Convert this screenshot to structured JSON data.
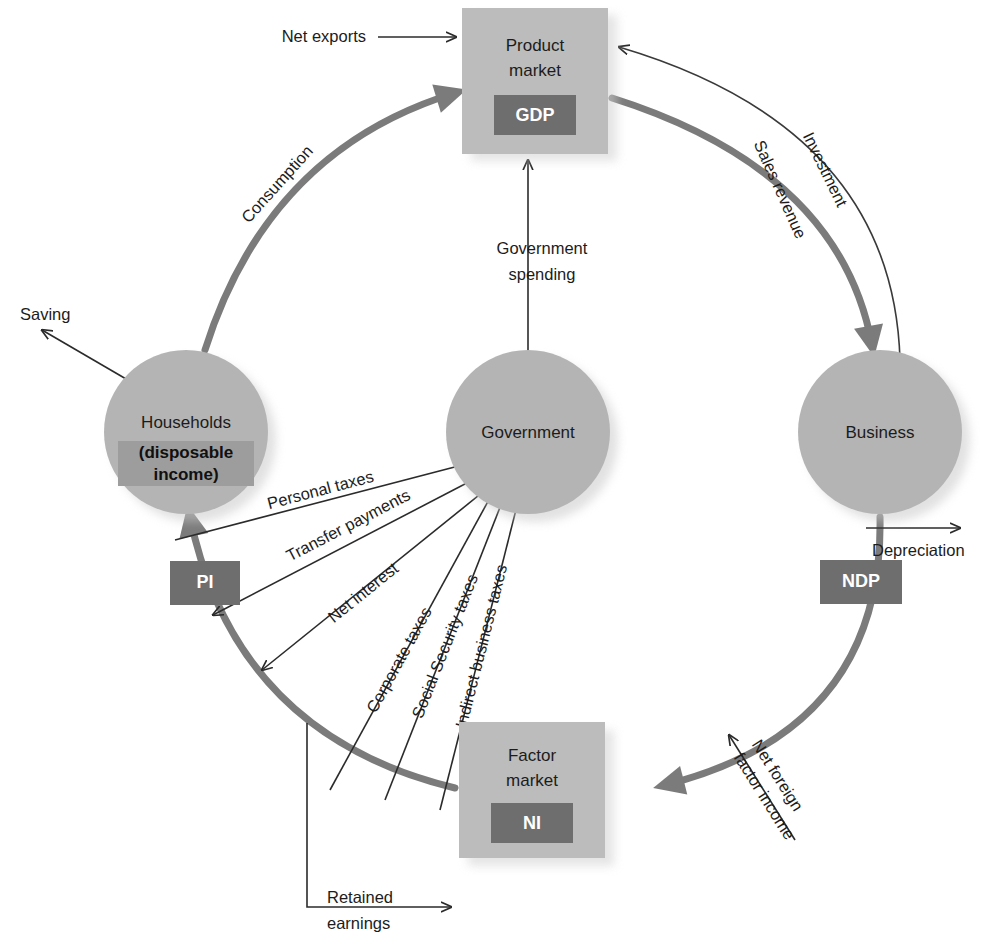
{
  "diagram": {
    "colors": {
      "node": "#b4b4b4",
      "box": "#bcbcbc",
      "badge": "#6e6e6e",
      "thick_flow": "#7b7b7b",
      "thin_flow": "#2b2b2b",
      "text": "#1c1c1c",
      "badge_text": "#ffffff",
      "background": "#ffffff"
    },
    "nodes": [
      {
        "id": "product-market",
        "shape": "box",
        "label_line1": "Product",
        "label_line2": "market",
        "badge": "GDP"
      },
      {
        "id": "households",
        "shape": "circle",
        "label_line1": "Households",
        "sub_line1": "(disposable",
        "sub_line2": "income)"
      },
      {
        "id": "government",
        "shape": "circle",
        "label_line1": "Government"
      },
      {
        "id": "business",
        "shape": "circle",
        "label_line1": "Business"
      },
      {
        "id": "factor-market",
        "shape": "box",
        "label_line1": "Factor",
        "label_line2": "market",
        "badge": "NI"
      }
    ],
    "badges_on_arc": [
      {
        "id": "pi-badge",
        "text": "PI"
      },
      {
        "id": "ndp-badge",
        "text": "NDP"
      }
    ],
    "flows": [
      {
        "id": "net-exports",
        "label": "Net exports",
        "style": "thin",
        "to": "product-market"
      },
      {
        "id": "consumption",
        "label": "Consumption",
        "style": "thick",
        "from": "households",
        "to": "product-market"
      },
      {
        "id": "investment",
        "label": "Investment",
        "style": "thin",
        "from": "business",
        "to": "product-market"
      },
      {
        "id": "sales-revenue",
        "label": "Sales revenue",
        "style": "thick",
        "from": "product-market",
        "to": "business"
      },
      {
        "id": "government-spending",
        "label_line1": "Government",
        "label_line2": "spending",
        "label": "Government spending",
        "style": "thin",
        "from": "government",
        "to": "product-market"
      },
      {
        "id": "saving",
        "label": "Saving",
        "style": "thin",
        "from": "households"
      },
      {
        "id": "depreciation",
        "label": "Depreciation",
        "style": "thin",
        "from": "business"
      },
      {
        "id": "personal-taxes",
        "label": "Personal taxes",
        "style": "thin",
        "from": "households",
        "to": "government"
      },
      {
        "id": "transfer-payments",
        "label": "Transfer payments",
        "style": "thin",
        "from": "government",
        "to": "households"
      },
      {
        "id": "net-interest",
        "label": "Net interest",
        "style": "thin",
        "from": "government",
        "to": "households"
      },
      {
        "id": "corporate-taxes",
        "label": "Corporate taxes",
        "style": "thin",
        "to": "government"
      },
      {
        "id": "social-security-taxes",
        "label": "Social Security taxes",
        "style": "thin",
        "to": "government"
      },
      {
        "id": "indirect-business-taxes",
        "label": "Indirect business taxes",
        "style": "thin",
        "to": "government"
      },
      {
        "id": "net-foreign-factor-income",
        "label_line1": "Net foreign",
        "label_line2": "factor income",
        "label": "Net foreign factor income",
        "style": "thin",
        "to": "factor-market"
      },
      {
        "id": "retained-earnings",
        "label_line1": "Retained",
        "label_line2": "earnings",
        "label": "Retained earnings",
        "style": "thin"
      }
    ]
  }
}
